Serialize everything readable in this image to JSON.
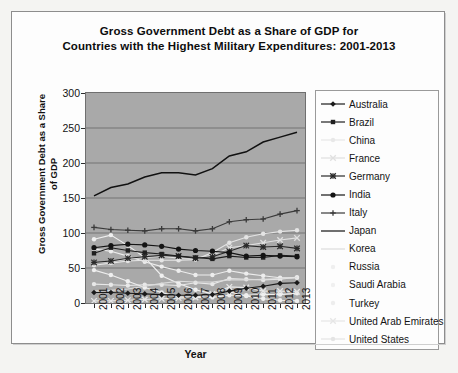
{
  "chart_data": {
    "type": "line",
    "title": "Gross Government Debt as a Share of GDP for Countries with the Highest Military Expenditures: 2001-2013",
    "title_lines": [
      "Gross Government Debt as a Share of GDP for",
      "Countries with the Highest Military Expenditures: 2001-2013"
    ],
    "xlabel": "Year",
    "ylabel": "Gross Government Debt as a Share of GDP",
    "ylabel_lines": [
      "Gross Government Debt as a Share",
      "of GDP"
    ],
    "x": [
      2001,
      2002,
      2003,
      2004,
      2005,
      2006,
      2007,
      2008,
      2009,
      2010,
      2011,
      2012,
      2013
    ],
    "categories": [
      "2001",
      "2002",
      "2003",
      "2004",
      "2005",
      "2006",
      "2007",
      "2008",
      "2009",
      "2010",
      "2011",
      "2012",
      "2013"
    ],
    "ylim": [
      0,
      300
    ],
    "yticks": [
      0,
      50,
      100,
      150,
      200,
      250,
      300
    ],
    "grid": "horizontal",
    "legend_position": "right",
    "plot_background": "#a9a9a9",
    "series": [
      {
        "name": "Australia",
        "marker": "diamond",
        "color": "#1a1a1a",
        "values": [
          15,
          15,
          14,
          13,
          12,
          11,
          11,
          12,
          17,
          21,
          24,
          28,
          29
        ]
      },
      {
        "name": "Brazil",
        "marker": "square",
        "color": "#1f1f1f",
        "values": [
          71,
          79,
          75,
          72,
          70,
          67,
          65,
          63,
          67,
          65,
          65,
          68,
          67
        ]
      },
      {
        "name": "China",
        "marker": "dot",
        "color": "#e8e8e8",
        "values": [
          27,
          26,
          25,
          26,
          26,
          25,
          29,
          27,
          35,
          34,
          33,
          34,
          37
        ]
      },
      {
        "name": "France",
        "marker": "cross",
        "color": "#e0e0e0",
        "values": [
          58,
          59,
          63,
          65,
          67,
          64,
          64,
          68,
          79,
          82,
          86,
          90,
          93
        ]
      },
      {
        "name": "Germany",
        "marker": "star",
        "color": "#2a2a2a",
        "values": [
          58,
          60,
          64,
          66,
          68,
          67,
          64,
          66,
          74,
          82,
          80,
          81,
          78
        ]
      },
      {
        "name": "India",
        "marker": "circle",
        "color": "#141414",
        "values": [
          79,
          82,
          84,
          83,
          81,
          77,
          75,
          74,
          72,
          67,
          68,
          67,
          66
        ]
      },
      {
        "name": "Italy",
        "marker": "plus",
        "color": "#3a3a3a",
        "values": [
          108,
          105,
          104,
          103,
          106,
          106,
          103,
          106,
          116,
          119,
          120,
          127,
          132
        ]
      },
      {
        "name": "Japan",
        "marker": "line",
        "color": "#111111",
        "values": [
          153,
          165,
          170,
          180,
          186,
          186,
          183,
          192,
          210,
          216,
          230,
          237,
          244
        ]
      },
      {
        "name": "Korea",
        "marker": "line",
        "color": "#dcdcdc",
        "values": [
          17,
          18,
          20,
          24,
          28,
          31,
          30,
          30,
          33,
          33,
          34,
          35,
          36
        ]
      },
      {
        "name": "Russia",
        "marker": "dot",
        "color": "#efefef",
        "values": [
          47,
          40,
          31,
          22,
          15,
          9,
          8,
          8,
          11,
          11,
          12,
          12,
          14
        ]
      },
      {
        "name": "Saudi Arabia",
        "marker": "dot",
        "color": "#f0f0f0",
        "values": [
          91,
          97,
          82,
          65,
          39,
          28,
          19,
          13,
          16,
          10,
          6,
          4,
          3
        ]
      },
      {
        "name": "Turkey",
        "marker": "dot",
        "color": "#ededed",
        "values": [
          77,
          74,
          67,
          59,
          52,
          46,
          40,
          40,
          46,
          42,
          39,
          36,
          36
        ]
      },
      {
        "name": "United Arab Emirates",
        "marker": "cross",
        "color": "#e6e6e6",
        "values": [
          3,
          3,
          4,
          5,
          6,
          7,
          8,
          13,
          23,
          22,
          17,
          17,
          16
        ]
      },
      {
        "name": "United States",
        "marker": "dot",
        "color": "#e4e4e4",
        "values": [
          54,
          57,
          60,
          61,
          61,
          61,
          62,
          72,
          86,
          94,
          99,
          102,
          104
        ]
      }
    ],
    "legend_entries": [
      {
        "label": "Australia",
        "marker": "diamond",
        "color": "#1a1a1a"
      },
      {
        "label": "Brazil",
        "marker": "square",
        "color": "#1f1f1f"
      },
      {
        "label": "China",
        "marker": "dot",
        "color": "#e8e8e8"
      },
      {
        "label": "France",
        "marker": "cross",
        "color": "#e0e0e0"
      },
      {
        "label": "Germany",
        "marker": "star",
        "color": "#2a2a2a"
      },
      {
        "label": "India",
        "marker": "circle",
        "color": "#141414"
      },
      {
        "label": "Italy",
        "marker": "plus",
        "color": "#3a3a3a"
      },
      {
        "label": "Japan",
        "marker": "line",
        "color": "#111111"
      },
      {
        "label": "Korea",
        "marker": "line",
        "color": "#dcdcdc"
      },
      {
        "label": "Russia",
        "marker": "dot",
        "color": "#efefef"
      },
      {
        "label": "Saudi Arabia",
        "marker": "dot",
        "color": "#f0f0f0"
      },
      {
        "label": "Turkey",
        "marker": "dot",
        "color": "#ededed"
      },
      {
        "label": "United Arab Emirates",
        "marker": "cross",
        "color": "#e6e6e6"
      },
      {
        "label": "United States",
        "marker": "dot",
        "color": "#e4e4e4"
      }
    ]
  }
}
